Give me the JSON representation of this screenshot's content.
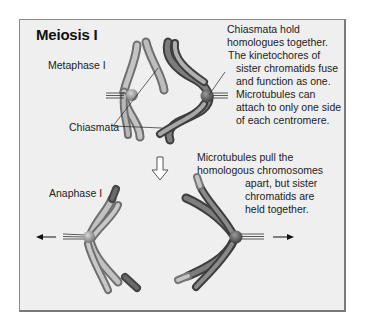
{
  "figure": {
    "title": "Meiosis I",
    "stages": {
      "metaphase": {
        "label": "Metaphase I",
        "chiasmata_label": "Chiasmata",
        "note_lines": [
          "Chiasmata hold",
          "homologues together.",
          "The kinetochores of",
          "sister chromatids fuse",
          "and function as one.",
          "Microtubules can",
          "attach to only one side",
          "of each centromere."
        ]
      },
      "anaphase": {
        "label": "Anaphase I",
        "note_lines": [
          "Microtubules pull the",
          "homologous chromosomes",
          "apart, but sister",
          "chromatids are",
          "held together."
        ]
      }
    },
    "icons": [
      "down-arrow-icon",
      "left-arrow-icon",
      "right-arrow-icon"
    ],
    "colors": {
      "panel_bg": "#efefef",
      "panel_border": "#8a8a8a",
      "light_chromosome": "#a9a9a9",
      "dark_chromosome": "#555555",
      "centromere": "#8c8c8c"
    }
  }
}
